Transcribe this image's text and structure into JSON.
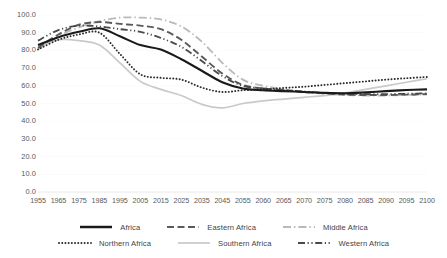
{
  "chart_data": {
    "type": "line",
    "title": "",
    "subtitle": "",
    "xlabel": "",
    "ylabel": "",
    "ylim": [
      0.0,
      100.0
    ],
    "grid": false,
    "legend_position": "bottom",
    "y_ticks": [
      "0.0",
      "10.0",
      "20.0",
      "30.0",
      "40.0",
      "50.0",
      "60.0",
      "70.0",
      "80.0",
      "90.0",
      "100.0"
    ],
    "y_tick_values": [
      0,
      10,
      20,
      30,
      40,
      50,
      60,
      70,
      80,
      90,
      100
    ],
    "categories": [
      "1955",
      "1965",
      "1975",
      "1985",
      "1995",
      "2005",
      "2015",
      "2025",
      "2035",
      "2045",
      "2055",
      "2060",
      "2065",
      "2070",
      "2075",
      "2080",
      "2085",
      "2090",
      "2095",
      "2100"
    ],
    "x": [
      1955,
      1965,
      1975,
      1985,
      1995,
      2005,
      2015,
      2025,
      2035,
      2045,
      2055,
      2060,
      2065,
      2070,
      2075,
      2080,
      2085,
      2090,
      2095,
      2100
    ],
    "series": [
      {
        "name": "Africa",
        "style": "solid",
        "color": "#1a1a1a",
        "width": 2.1,
        "values": [
          83.0,
          87.5,
          90.5,
          92.5,
          88.0,
          83.0,
          80.5,
          75.0,
          68.5,
          62.0,
          58.5,
          57.5,
          57.0,
          56.5,
          56.0,
          55.8,
          56.3,
          57.0,
          57.6,
          58.0
        ]
      },
      {
        "name": "Eastern Africa",
        "style": "dashed",
        "color": "#5a5a5a",
        "width": 1.9,
        "values": [
          81.5,
          89.0,
          94.5,
          96.0,
          95.0,
          94.0,
          92.0,
          86.0,
          76.5,
          67.0,
          60.5,
          58.5,
          57.5,
          56.5,
          55.8,
          55.0,
          54.8,
          54.8,
          55.0,
          55.3
        ]
      },
      {
        "name": "Middle Africa",
        "style": "dashdot-light",
        "color": "#b9b9b9",
        "width": 1.8,
        "values": [
          80.5,
          88.0,
          93.0,
          96.5,
          98.5,
          98.5,
          97.5,
          93.5,
          85.0,
          73.0,
          63.5,
          60.0,
          58.0,
          56.5,
          55.5,
          54.8,
          54.5,
          54.5,
          54.8,
          55.2
        ]
      },
      {
        "name": "Northern Africa",
        "style": "dotted",
        "color": "#2b2b2b",
        "width": 1.9,
        "values": [
          80.5,
          86.0,
          89.0,
          90.0,
          78.0,
          66.5,
          64.5,
          63.5,
          59.0,
          56.5,
          57.5,
          58.0,
          58.8,
          59.5,
          60.5,
          61.5,
          62.5,
          63.5,
          64.3,
          65.0
        ]
      },
      {
        "name": "Southern Africa",
        "style": "solid-light",
        "color": "#c9c9c9",
        "width": 1.7,
        "values": [
          82.0,
          86.0,
          85.5,
          83.0,
          73.0,
          62.5,
          58.0,
          54.5,
          49.5,
          47.5,
          50.0,
          51.5,
          52.5,
          53.5,
          54.5,
          56.0,
          58.0,
          60.0,
          62.0,
          64.0
        ]
      },
      {
        "name": "Western Africa",
        "style": "dashdotdot",
        "color": "#4a4a4a",
        "width": 1.8,
        "values": [
          85.5,
          91.5,
          94.0,
          93.5,
          92.0,
          90.5,
          87.0,
          82.0,
          74.0,
          65.5,
          60.0,
          58.5,
          57.5,
          56.8,
          56.0,
          55.5,
          55.3,
          55.3,
          55.5,
          55.8
        ]
      }
    ]
  },
  "legend": {
    "rows": [
      [
        {
          "label": "Africa",
          "series": 0
        },
        {
          "label": "Eastern Africa",
          "series": 1
        },
        {
          "label": "Middle Africa",
          "series": 2
        }
      ],
      [
        {
          "label": "Northern Africa",
          "series": 3
        },
        {
          "label": "Southern Africa",
          "series": 4
        },
        {
          "label": "Western Africa",
          "series": 5
        }
      ]
    ]
  }
}
